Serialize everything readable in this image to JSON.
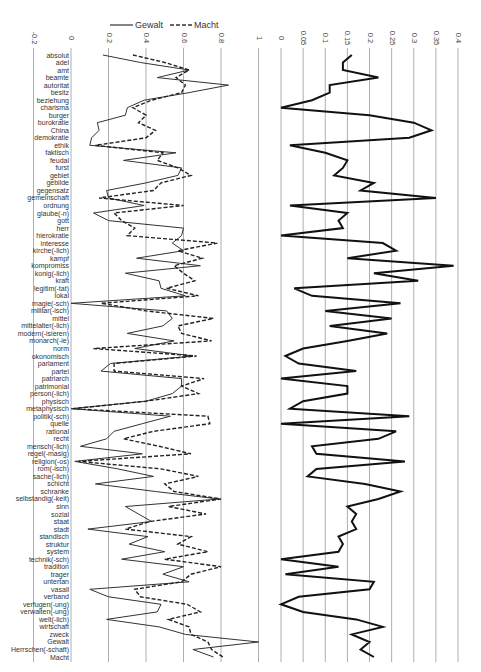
{
  "legend": {
    "items": [
      {
        "label": "Gewalt",
        "style": "solid"
      },
      {
        "label": "Macht",
        "style": "dashed"
      }
    ]
  },
  "chart_data": [
    {
      "type": "line",
      "orientation": "vertical-categories",
      "title": "",
      "xlabel": "",
      "ylabel": "",
      "axis_ticks": [
        "-0.2",
        "0",
        "0.2",
        "0.4",
        "0.6",
        "0.8",
        "1"
      ],
      "xlim": [
        -0.2,
        1
      ],
      "grid": true,
      "legend_position": "top",
      "categories": [
        "absolut",
        "adel",
        "amt",
        "beamte",
        "autoritat",
        "besitz",
        "beziehung",
        "charisma",
        "burger",
        "burokratie",
        "China",
        "demokratie",
        "ethik",
        "faktisch",
        "feudal",
        "furst",
        "gebiet",
        "gebilde",
        "gegensatz",
        "gemeinschaft",
        "ordnung",
        "glaube(-n)",
        "gott",
        "herr",
        "hierokratie",
        "interesse",
        "kirche(-lich)",
        "kampf",
        "kompromiss",
        "konig(-lich)",
        "kraft",
        "legitim(-tat)",
        "lokal",
        "magie(-sch)",
        "militar(-isch)",
        "mittel",
        "mittelalter(-lich)",
        "modern(-isieren)",
        "monarch(-ie)",
        "norm",
        "okonomisch",
        "parlament",
        "partei",
        "patriarch",
        "patrimonial",
        "person(-lich)",
        "physisch",
        "metaphysisch",
        "politik(-sch)",
        "quelle",
        "rational",
        "recht",
        "mensch(-lich)",
        "regel(-masig)",
        "religion(-os)",
        "rom(-isch)",
        "sache(-lich)",
        "schicht",
        "schranke",
        "selbstandig(-keit)",
        "sinn",
        "sozial",
        "staat",
        "stadt",
        "standisch",
        "struktur",
        "system",
        "technik(-sch)",
        "tradition",
        "trager",
        "untertan",
        "vasall",
        "verband",
        "verfugen(-ung)",
        "verwalten(-ung)",
        "welt(-lich)",
        "wirtschaft",
        "zweck",
        "Gewalt",
        "Herrschen(-schaft)",
        "Macht"
      ],
      "series": [
        {
          "name": "Gewalt",
          "style": "solid",
          "values": [
            0.17,
            0.37,
            0.63,
            0.46,
            0.84,
            0.63,
            0.39,
            0.3,
            0.29,
            0.14,
            0.15,
            0.11,
            0.1,
            0.56,
            0.28,
            0.59,
            0.57,
            0.4,
            0.19,
            0.2,
            0.39,
            0.12,
            0.2,
            0.6,
            0.59,
            0.54,
            0.6,
            0.35,
            0.69,
            0.29,
            0.47,
            0.48,
            0.61,
            0.0,
            0.51,
            0.54,
            0.49,
            0.3,
            0.55,
            0.34,
            0.65,
            0.21,
            0.16,
            0.59,
            0.59,
            0.54,
            0.4,
            0.0,
            0.53,
            0.38,
            0.23,
            0.19,
            0.05,
            0.38,
            0.02,
            0.25,
            0.44,
            0.13,
            0.45,
            0.79,
            0.29,
            0.36,
            0.43,
            0.09,
            0.41,
            0.31,
            0.5,
            0.27,
            0.6,
            0.49,
            0.63,
            0.1,
            0.2,
            0.48,
            0.46,
            0.19,
            0.47,
            0.61,
            1.0,
            0.65,
            0.76
          ]
        },
        {
          "name": "Macht",
          "style": "dashed",
          "values": [
            0.33,
            0.5,
            0.63,
            0.56,
            0.61,
            0.59,
            0.43,
            0.33,
            0.4,
            0.36,
            0.45,
            0.4,
            0.13,
            0.49,
            0.46,
            0.57,
            0.64,
            0.48,
            0.44,
            0.15,
            0.6,
            0.23,
            0.27,
            0.34,
            0.3,
            0.78,
            0.57,
            0.7,
            0.55,
            0.6,
            0.66,
            0.51,
            0.68,
            0.16,
            0.4,
            0.76,
            0.57,
            0.59,
            0.75,
            0.12,
            0.67,
            0.23,
            0.23,
            0.71,
            0.59,
            0.68,
            0.4,
            0.01,
            0.73,
            0.74,
            0.44,
            0.28,
            0.47,
            0.64,
            0.04,
            0.48,
            0.68,
            0.5,
            0.55,
            0.8,
            0.52,
            0.72,
            0.42,
            0.29,
            0.64,
            0.57,
            0.73,
            0.5,
            0.8,
            0.64,
            0.59,
            0.34,
            0.37,
            0.62,
            0.69,
            0.52,
            0.63,
            0.64,
            0.73,
            0.75,
            0.81
          ]
        }
      ]
    },
    {
      "type": "line",
      "orientation": "vertical-categories",
      "title": "",
      "xlabel": "",
      "ylabel": "",
      "axis_ticks": [
        "0",
        "0.05",
        "0.1",
        "0.15",
        "0.2",
        "0.25",
        "0.3",
        "0.35",
        "0.4"
      ],
      "xlim": [
        0,
        0.4
      ],
      "grid": true,
      "series": [
        {
          "name": "difference",
          "style": "solid-bold",
          "values": [
            0.16,
            0.14,
            0.14,
            0.22,
            0.11,
            0.11,
            0.07,
            0.0,
            0.2,
            0.3,
            0.34,
            0.29,
            0.02,
            0.1,
            0.15,
            0.14,
            0.12,
            0.21,
            0.18,
            0.35,
            0.02,
            0.15,
            0.13,
            0.14,
            0.0,
            0.23,
            0.26,
            0.15,
            0.39,
            0.21,
            0.31,
            0.03,
            0.07,
            0.27,
            0.1,
            0.25,
            0.11,
            0.24,
            0.15,
            0.05,
            0.01,
            0.04,
            0.17,
            0.0,
            0.15,
            0.15,
            0.05,
            0.02,
            0.29,
            0.0,
            0.26,
            0.22,
            0.07,
            0.08,
            0.28,
            0.08,
            0.06,
            0.19,
            0.27,
            0.22,
            0.15,
            0.17,
            0.16,
            0.17,
            0.13,
            0.14,
            0.13,
            0.0,
            0.13,
            0.01,
            0.21,
            0.2,
            0.04,
            0.0,
            0.05,
            0.17,
            0.23,
            0.16,
            0.2,
            0.18,
            0.21
          ]
        }
      ]
    }
  ]
}
